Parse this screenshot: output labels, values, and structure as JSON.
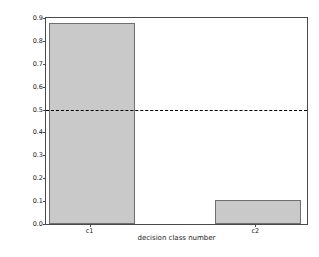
{
  "chart_data": {
    "type": "bar",
    "title": "",
    "categories": [
      "c1",
      "c2"
    ],
    "values": [
      0.88,
      0.105
    ],
    "series": [
      {
        "name": "the percentage size of decision class",
        "values": [
          0.88,
          0.105
        ]
      }
    ],
    "xlabel": "decision class number",
    "ylabel": "the percentage size of decision class",
    "ylim": [
      0.0,
      0.9
    ],
    "yticks": [
      "0.0",
      "0.1",
      "0.2",
      "0.3",
      "0.4",
      "0.5",
      "0.6",
      "0.7",
      "0.8",
      "0.9"
    ],
    "ytick_values": [
      0.0,
      0.1,
      0.2,
      0.3,
      0.4,
      0.5,
      0.6,
      0.7,
      0.8,
      0.9
    ],
    "xticks": [
      "c1",
      "c2"
    ],
    "grid": false,
    "legend": "none",
    "annotations": [
      {
        "name": "threshold-line",
        "type": "hline",
        "value": 0.5,
        "style": "dashed",
        "color": "#000000"
      }
    ],
    "colors": {
      "bar_fill": "#c9c9c9",
      "bar_edge": "#6e6e6e",
      "axis": "#4a4a4a",
      "text": "#1a1a1a",
      "background": "#ffffff",
      "threshold": "#000000"
    },
    "watermark": ""
  }
}
